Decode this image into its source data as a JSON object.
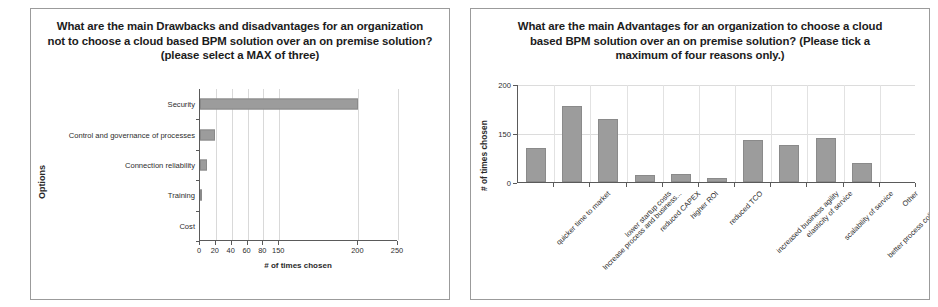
{
  "left_panel": {
    "title_lines": [
      "What are the main Drawbacks and disadvantages for an organization",
      "not to choose a cloud based BPM solution over an on premise solution?",
      "(please select a MAX of three)"
    ],
    "chart_data": {
      "type": "bar",
      "orientation": "horizontal",
      "title": "",
      "xlabel": "# of times chosen",
      "ylabel": "Options",
      "categories": [
        "Security",
        "Control and governance of processes",
        "Connection reliability",
        "Training",
        "Cost"
      ],
      "values": [
        200,
        19,
        9,
        3,
        0
      ],
      "xticks": [
        "0",
        "20",
        "40",
        "60",
        "80",
        "150",
        "200",
        "250"
      ],
      "xtick_values": [
        0,
        20,
        40,
        60,
        80,
        100,
        200,
        250
      ],
      "xlim": [
        0,
        250
      ],
      "grid": true,
      "legend": "none",
      "bar_color": "#9c9c9c"
    }
  },
  "right_panel": {
    "title_lines": [
      "What are the main Advantages for an organization to choose a cloud",
      "based BPM solution over an on premise solution? (Please tick a",
      "maximum of four reasons only.)"
    ],
    "chart_data": {
      "type": "bar",
      "orientation": "vertical",
      "title": "",
      "xlabel": "",
      "ylabel": "# of times chosen",
      "categories": [
        "quicker time to market",
        "Increase process and business...",
        "lower startup costs",
        "reduced CAPEX",
        "higher ROI",
        "reduced TCO",
        "increased business agility",
        "elasticity of service",
        "scalability of service",
        "better process collaboration",
        "Other"
      ],
      "values": [
        70,
        155,
        128,
        14,
        16,
        8,
        85,
        75,
        90,
        38,
        0
      ],
      "yticks": [
        "0",
        "150",
        "200"
      ],
      "ytick_values": [
        0,
        100,
        200
      ],
      "ylim": [
        0,
        200
      ],
      "grid": true,
      "legend": "none",
      "bar_color": "#9c9c9c"
    }
  }
}
